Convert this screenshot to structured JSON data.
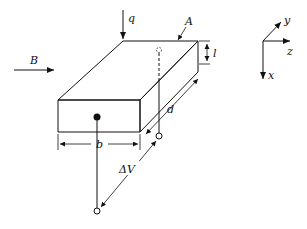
{
  "diagram": {
    "type": "hall-effect-slab",
    "labels": {
      "field": "B",
      "flux": "q",
      "area": "A",
      "thickness": "l",
      "width": "b",
      "depth": "d",
      "voltage": "ΔV"
    },
    "axes": {
      "x": "x",
      "y": "y",
      "z": "z"
    },
    "colors": {
      "stroke": "#111111",
      "background": "#ffffff"
    }
  }
}
